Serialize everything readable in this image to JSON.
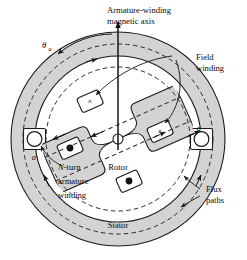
{
  "figure": {
    "title_note": "Salient-pole synchronous machine cross-section",
    "colors": {
      "iron_fill": "#d3d3d3",
      "gap_fill": "#ffffff",
      "line": "#1a1a1a",
      "dashed_flux": "#2b2b2b",
      "background": "#ffffff"
    }
  },
  "labels": {
    "magnetic_axis_line1": "Armature-winding",
    "magnetic_axis_line2": "magnetic axis",
    "theta": "θ",
    "theta_subscript": "a",
    "field_winding_line1": "Field",
    "field_winding_line2": "winding",
    "flux_paths_line1": "Flux",
    "flux_paths_line2": "paths",
    "stator": "Stator",
    "rotor": "Rotor",
    "armature_line1_italic": "N",
    "armature_line1_rest": "-turn",
    "armature_line2": "armature",
    "armature_line3": "winding",
    "coil_side_a": "a",
    "coil_side_minus_a": "−a"
  },
  "symbols": {
    "current_into_page": "×",
    "current_out_of_page": "•",
    "field_slot_count": 2,
    "armature_dot_slot_count": 2,
    "armature_circle_slot_count": 2
  }
}
